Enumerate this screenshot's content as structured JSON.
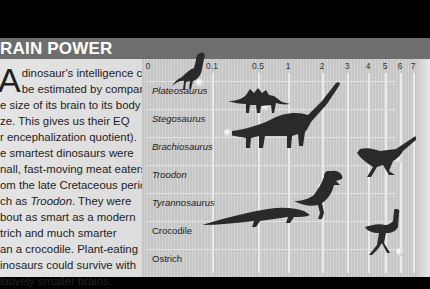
{
  "header": {
    "title": "RAIN POWER"
  },
  "article": {
    "dropcap": "A",
    "lines": [
      "dinosaur's intelligence can",
      "be estimated by comparing",
      "e size of its brain to its body",
      "ze. This gives us their EQ",
      "r encephalization quotient).",
      "e smartest dinosaurs were",
      "nall, fast-moving meat eaters",
      "om the late Cretaceous period,",
      "ch as Troodon. They were",
      "bout as smart as a modern",
      "trich and much smarter",
      "an a crocodile. Plant-eating",
      "inosaurs could survive with",
      "latively smaller brains."
    ]
  },
  "chart_data": {
    "type": "scatter",
    "xlabel": "Encephalization quotient (EQ)",
    "ylabel": "",
    "x_scale": "nonlinear",
    "x_ticks": [
      "0",
      "0.1",
      "0.5",
      "1",
      "2",
      "3",
      "4",
      "5",
      "6",
      "7"
    ],
    "categories": [
      "Plateosaurus",
      "Stegosaurus",
      "Brachiosaurus",
      "Troodon",
      "Tyrannosaurus",
      "Crocodile",
      "Ostrich"
    ],
    "values": [
      0.07,
      0.6,
      0.2,
      5.8,
      2.0,
      0.9,
      6.0
    ],
    "grid": true,
    "legend": "none"
  },
  "tick_positions": [
    6,
    70,
    116,
    146,
    180,
    205,
    226,
    243,
    258,
    271
  ],
  "rows": [
    {
      "label": "Plateosaurus",
      "italic": true,
      "top": 22,
      "marker_x": 58,
      "marker_y": 24
    },
    {
      "label": "Stegosaurus",
      "italic": true,
      "top": 50,
      "marker_x": 124,
      "marker_y": 48
    },
    {
      "label": "Brachiosaurus",
      "italic": true,
      "top": 78,
      "marker_x": 86,
      "marker_y": 74
    },
    {
      "label": "Troodon",
      "italic": true,
      "top": 106,
      "marker_x": 256,
      "marker_y": 100
    },
    {
      "label": "Tyrannosaurus",
      "italic": true,
      "top": 134,
      "marker_x": 180,
      "marker_y": 128
    },
    {
      "label": "Crocodile",
      "italic": false,
      "top": 162,
      "marker_x": 144,
      "marker_y": 157
    },
    {
      "label": "Ostrich",
      "italic": false,
      "top": 190,
      "marker_x": 258,
      "marker_y": 193
    }
  ]
}
